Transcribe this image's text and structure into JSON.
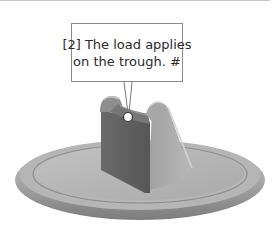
{
  "callout": {
    "line1": "[2] The load applies",
    "line2": "on the trough.  #"
  },
  "figure": {
    "marker": "load point"
  },
  "colors": {
    "background": "#ffffff",
    "callout_border": "#8a8a8a",
    "part_dark": "#5e5e5e",
    "part_mid": "#9a9a9a",
    "part_light": "#c4c4c4"
  }
}
